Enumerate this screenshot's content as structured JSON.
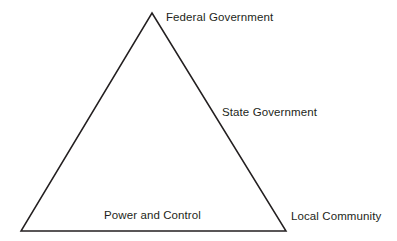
{
  "diagram": {
    "type": "triangle-relationship-diagram",
    "background_color": "#ffffff",
    "stroke_color": "#231f20",
    "text_color": "#231f20",
    "vertices": {
      "apex": [
        152,
        13
      ],
      "bottom_left": [
        21,
        231
      ],
      "bottom_right": [
        286,
        231
      ]
    },
    "labels": {
      "apex": "Federal Government",
      "right_edge": "State Government",
      "base": "Power and Control",
      "bottom_right_vertex": "Local Community"
    }
  }
}
